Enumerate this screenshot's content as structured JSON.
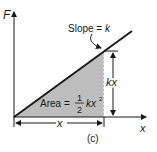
{
  "figure": {
    "caption": "(c)",
    "axes": {
      "y_label": "F",
      "x_label": "x"
    },
    "annotations": {
      "slope_prefix": "Slope = ",
      "slope_var": "k",
      "height_label": "kx",
      "width_label": "x",
      "area_prefix": "Area = ",
      "area_frac_num": "1",
      "area_frac_den": "2",
      "area_expr": "kx",
      "area_exp": "2"
    },
    "colors": {
      "line": "#1a1a1a",
      "fill": "#bdbdbd",
      "background": "#ffffff"
    }
  }
}
